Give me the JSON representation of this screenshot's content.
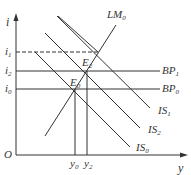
{
  "axes": {
    "y_label": "i",
    "x_label": "y",
    "origin": "O"
  },
  "y_ticks": [
    {
      "base": "i",
      "sub": "1",
      "y": 52
    },
    {
      "base": "i",
      "sub": "2",
      "y": 71
    },
    {
      "base": "i",
      "sub": "0",
      "y": 89
    }
  ],
  "x_ticks": [
    {
      "base": "y",
      "sub": "0",
      "x": 75
    },
    {
      "base": "y",
      "sub": "2",
      "x": 87
    }
  ],
  "curves": {
    "LM0": {
      "base": "LM",
      "sub": "0"
    },
    "BP1": {
      "base": "BP",
      "sub": "1"
    },
    "BP0": {
      "base": "BP",
      "sub": "0"
    },
    "IS1": {
      "base": "IS",
      "sub": "1"
    },
    "IS2": {
      "base": "IS",
      "sub": "2"
    },
    "IS0": {
      "base": "IS",
      "sub": "0"
    }
  },
  "points": {
    "E2": {
      "base": "E",
      "sub": "2"
    },
    "E0": {
      "base": "E",
      "sub": "0"
    }
  },
  "colors": {
    "line": "#333333"
  }
}
